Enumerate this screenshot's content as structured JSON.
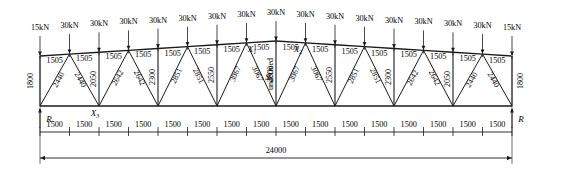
{
  "diagram": {
    "type": "structural-truss-elevation",
    "span": 24000,
    "end_height": 1800,
    "panel_count": 16,
    "units": "mm (lengths), kN (loads)"
  },
  "loads": {
    "end_load": "15kN",
    "interior_load": "30kN",
    "values": [
      "15kN",
      "30kN",
      "30kN",
      "30kN",
      "30kN",
      "30kN",
      "30kN",
      "30kN",
      "30kN",
      "30kN",
      "30kN",
      "30kN",
      "30kN",
      "30kN",
      "30kN",
      "30kN",
      "15kN"
    ]
  },
  "top_chord": {
    "segment_label": "1505",
    "segments": [
      "1505",
      "1505",
      "1505",
      "1505",
      "1505",
      "1505",
      "1505",
      "1505",
      "1505",
      "1505",
      "1505",
      "1505",
      "1505",
      "1505",
      "1505",
      "1505"
    ]
  },
  "bottom_dims": {
    "segment_label": "1500",
    "segments": [
      "1500",
      "1500",
      "1500",
      "1500",
      "1500",
      "1500",
      "1500",
      "1500",
      "1500",
      "1500",
      "1500",
      "1500",
      "1500",
      "1500",
      "1500",
      "1500"
    ],
    "total": "24000"
  },
  "end_posts": {
    "left": "1800",
    "right": "1800"
  },
  "web_members": {
    "left_half": [
      "2440",
      "2440",
      "2050",
      "2642",
      "2642",
      "2300",
      "2851",
      "2851",
      "2550",
      "3067",
      "3067"
    ],
    "center": "2800",
    "right_half": [
      "3067",
      "3067",
      "2550",
      "2851",
      "2851",
      "2300",
      "2642",
      "2642",
      "2050",
      "2440",
      "2440"
    ]
  },
  "annotations": {
    "x1": "X",
    "x1_sub": "1",
    "x2": "X",
    "x2_sub": "2",
    "x3": "X",
    "x3_sub": "3",
    "s1": "S",
    "s1_sub": "1",
    "reaction_left": "R",
    "reaction_right": "R"
  },
  "colors": {
    "line": "#1a1a1a",
    "text": "#000000",
    "background": "#ffffff"
  }
}
